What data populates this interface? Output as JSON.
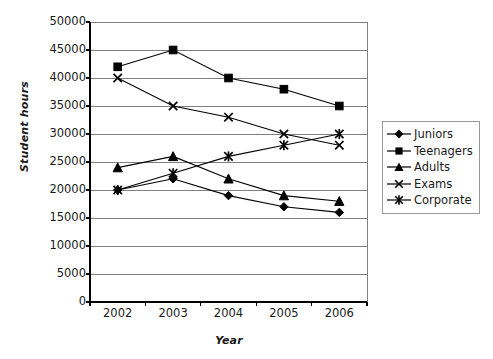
{
  "chart_data": {
    "type": "line",
    "title": "",
    "xlabel": "Year",
    "ylabel": "Student hours",
    "categories": [
      "2002",
      "2003",
      "2004",
      "2005",
      "2006"
    ],
    "x": [
      2002,
      2003,
      2004,
      2005,
      2006
    ],
    "ylim": [
      0,
      50000
    ],
    "yticks": [
      "0",
      "5000",
      "10000",
      "15000",
      "20000",
      "25000",
      "30000",
      "35000",
      "40000",
      "45000",
      "50000"
    ],
    "ytick_values": [
      0,
      5000,
      10000,
      15000,
      20000,
      25000,
      30000,
      35000,
      40000,
      45000,
      50000
    ],
    "grid": "horizontal",
    "legend_position": "right",
    "series": [
      {
        "name": "Juniors",
        "marker": "diamond",
        "color": "#000000",
        "values": [
          20000,
          22000,
          19000,
          17000,
          16000
        ]
      },
      {
        "name": "Teenagers",
        "marker": "square",
        "color": "#000000",
        "values": [
          42000,
          45000,
          40000,
          38000,
          35000
        ]
      },
      {
        "name": "Adults",
        "marker": "triangle",
        "color": "#000000",
        "values": [
          24000,
          26000,
          22000,
          19000,
          18000
        ]
      },
      {
        "name": "Exams",
        "marker": "cross",
        "color": "#000000",
        "values": [
          40000,
          35000,
          33000,
          30000,
          28000
        ]
      },
      {
        "name": "Corporate",
        "marker": "asterisk",
        "color": "#000000",
        "values": [
          20000,
          23000,
          26000,
          28000,
          30000
        ]
      }
    ]
  },
  "axes": {
    "ylabel": "Student hours",
    "xlabel": "Year"
  },
  "legend": {
    "items": [
      {
        "label": "Juniors"
      },
      {
        "label": "Teenagers"
      },
      {
        "label": "Adults"
      },
      {
        "label": "Exams"
      },
      {
        "label": "Corporate"
      }
    ]
  },
  "style": {
    "line_color": "#000000",
    "grid_color": "#808080",
    "axis_color": "#000000",
    "background": "#ffffff"
  }
}
